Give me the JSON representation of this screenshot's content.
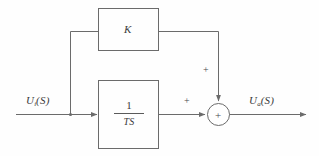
{
  "diagram": {
    "background_color": "#fefefe",
    "line_color": "#6b6b6b",
    "text_color": "#3a3a3a",
    "input": {
      "label_base": "U",
      "label_sub": "i",
      "label_arg": "(S)",
      "label_full": "Ui(S)"
    },
    "output": {
      "label_base": "U",
      "label_sub": "a",
      "label_arg": "(S)",
      "label_full": "Ua(S)"
    },
    "blocks": [
      {
        "id": "gain",
        "label": "K",
        "type": "gain"
      },
      {
        "id": "integrator",
        "numerator": "1",
        "denominator": "TS",
        "type": "transfer-function"
      }
    ],
    "summing_junction": {
      "operator": "+",
      "top_input_sign": "+",
      "left_input_sign": "+"
    }
  }
}
